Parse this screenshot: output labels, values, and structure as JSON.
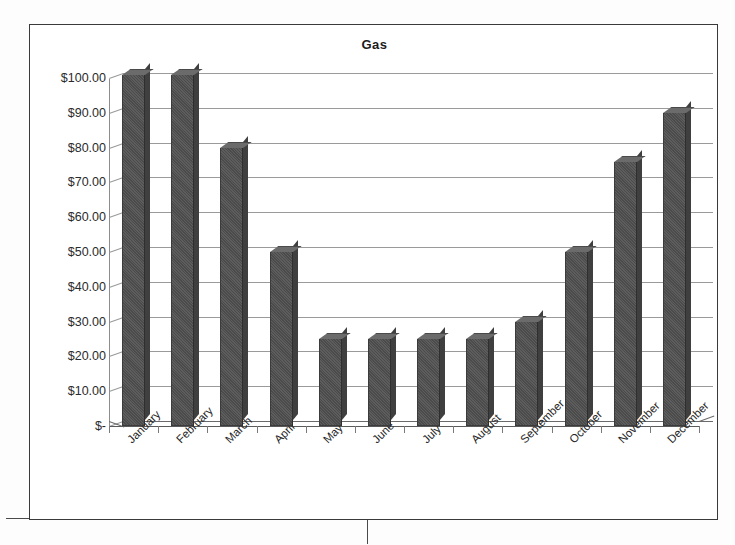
{
  "document": {
    "kind": "scanned-chart-page"
  },
  "chart": {
    "title": "Gas",
    "border_color": "#3a3a3a",
    "bar_color": "#525252",
    "gridline_color": "#9a9a9a",
    "plot_background": "#ffffff"
  },
  "chart_data": {
    "type": "bar",
    "title": "Gas",
    "xlabel": "",
    "ylabel": "",
    "categories": [
      "January",
      "February",
      "March",
      "April",
      "May",
      "June",
      "July",
      "August",
      "September",
      "October",
      "November",
      "December"
    ],
    "values": [
      101,
      101,
      80,
      50,
      25,
      25,
      25,
      25,
      30,
      50,
      76,
      90
    ],
    "value_prefix": "$",
    "ylim": [
      0,
      105
    ],
    "ytick_values": [
      0,
      10,
      20,
      30,
      40,
      50,
      60,
      70,
      80,
      90,
      100
    ],
    "ytick_labels": [
      "$-",
      "$10.00",
      "$20.00",
      "$30.00",
      "$40.00",
      "$50.00",
      "$60.00",
      "$70.00",
      "$80.00",
      "$90.00",
      "$100.00"
    ],
    "grid": true,
    "legend": false,
    "legend_position": "none",
    "style": "3d-column",
    "xlabel_rotation": -45,
    "series": [
      {
        "name": "Gas",
        "values": [
          101,
          101,
          80,
          50,
          25,
          25,
          25,
          25,
          30,
          50,
          76,
          90
        ]
      }
    ]
  }
}
